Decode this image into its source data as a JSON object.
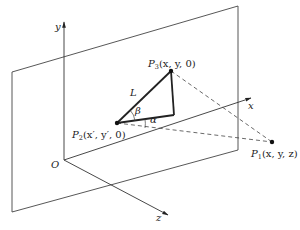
{
  "diagram": {
    "type": "3d-coordinate-geometry",
    "axes": {
      "y": "y",
      "x": "x",
      "z": "z",
      "origin": "O"
    },
    "points": {
      "p3": {
        "name": "P",
        "sub": "3",
        "coords": "(x, y, 0)"
      },
      "p2": {
        "name": "P",
        "sub": "2",
        "coords": "(x′, y′, 0)"
      },
      "p1": {
        "name": "P",
        "sub": "1",
        "coords": "(x, y, z)"
      }
    },
    "labels": {
      "length": "L",
      "beta": "β",
      "alpha": "α"
    },
    "colors": {
      "line": "#333333",
      "thick": "#222222",
      "background": "#ffffff"
    }
  }
}
